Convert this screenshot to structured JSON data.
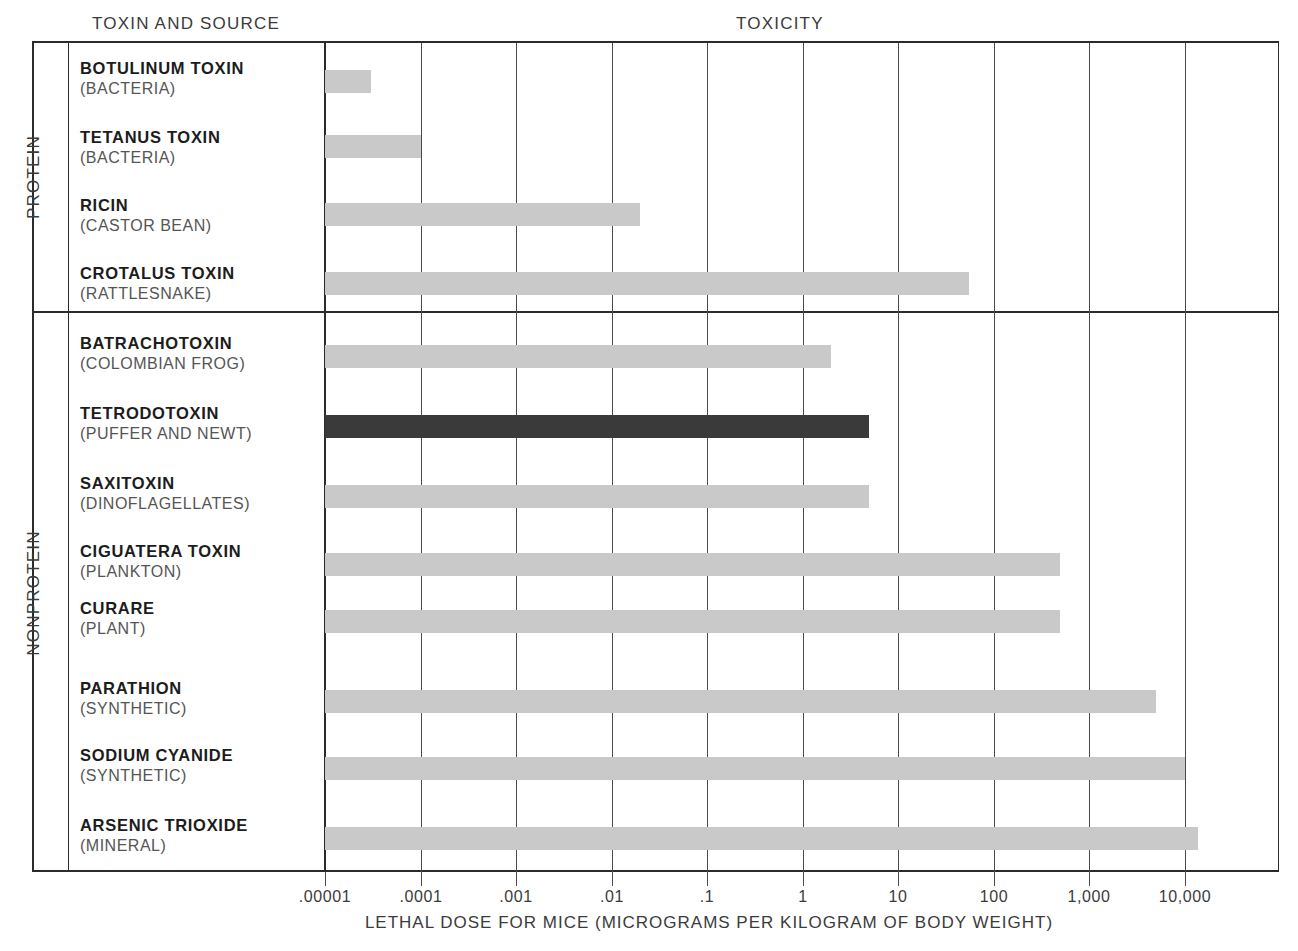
{
  "headings": {
    "left_column": "TOXIN AND SOURCE",
    "right_column": "TOXICITY"
  },
  "groups": [
    {
      "id": "protein",
      "label": "PROTEIN"
    },
    {
      "id": "nonprotein",
      "label": "NONPROTEIN"
    }
  ],
  "axis": {
    "title": "LETHAL DOSE FOR MICE (MICROGRAMS PER KILOGRAM OF BODY WEIGHT)",
    "tick_labels": [
      ".00001",
      ".0001",
      ".001",
      ".01",
      ".1",
      "1",
      "10",
      "100",
      "1,000",
      "10,000"
    ]
  },
  "colors": {
    "bar_light": "#c9c9c9",
    "bar_highlight": "#3a3a3a",
    "rule": "#2b2b2b",
    "gridline": "#4a4a4a",
    "text": "#1c1c1c",
    "text_secondary": "#555555"
  },
  "rows": [
    {
      "name": "BOTULINUM TOXIN",
      "source": "(BACTERIA)",
      "group": "protein",
      "value": 3e-05,
      "highlight": false
    },
    {
      "name": "TETANUS TOXIN",
      "source": "(BACTERIA)",
      "group": "protein",
      "value": 0.0001,
      "highlight": false
    },
    {
      "name": "RICIN",
      "source": "(CASTOR BEAN)",
      "group": "protein",
      "value": 0.02,
      "highlight": false
    },
    {
      "name": "CROTALUS TOXIN",
      "source": "(RATTLESNAKE)",
      "group": "protein",
      "value": 55,
      "highlight": false
    },
    {
      "name": "BATRACHOTOXIN",
      "source": "(COLOMBIAN FROG)",
      "group": "nonprotein",
      "value": 2,
      "highlight": false
    },
    {
      "name": "TETRODOTOXIN",
      "source": "(PUFFER AND NEWT)",
      "group": "nonprotein",
      "value": 5,
      "highlight": true
    },
    {
      "name": "SAXITOXIN",
      "source": "(DINOFLAGELLATES)",
      "group": "nonprotein",
      "value": 5,
      "highlight": false
    },
    {
      "name": "CIGUATERA TOXIN",
      "source": "(PLANKTON)",
      "group": "nonprotein",
      "value": 500,
      "highlight": false
    },
    {
      "name": "CURARE",
      "source": "(PLANT)",
      "group": "nonprotein",
      "value": 500,
      "highlight": false
    },
    {
      "name": "PARATHION",
      "source": "(SYNTHETIC)",
      "group": "nonprotein",
      "value": 5000,
      "highlight": false
    },
    {
      "name": "SODIUM CYANIDE",
      "source": "(SYNTHETIC)",
      "group": "nonprotein",
      "value": 10000,
      "highlight": false
    },
    {
      "name": "ARSENIC TRIOXIDE",
      "source": "(MINERAL)",
      "group": "nonprotein",
      "value": 14000,
      "highlight": false
    }
  ],
  "chart_data": {
    "type": "bar",
    "orientation": "horizontal",
    "title": "TOXICITY",
    "xlabel": "LETHAL DOSE FOR MICE (MICROGRAMS PER KILOGRAM OF BODY WEIGHT)",
    "ylabel": "TOXIN AND SOURCE",
    "xscale": "log",
    "xlim": [
      1e-05,
      1000000
    ],
    "xticks": [
      1e-05,
      0.0001,
      0.001,
      0.01,
      0.1,
      1,
      10,
      100,
      1000,
      10000
    ],
    "xticklabels": [
      ".00001",
      ".0001",
      ".001",
      ".01",
      ".1",
      "1",
      "10",
      "100",
      "1,000",
      "10,000"
    ],
    "grid": "vertical",
    "legend": "none",
    "categories": [
      "BOTULINUM TOXIN (BACTERIA)",
      "TETANUS TOXIN (BACTERIA)",
      "RICIN (CASTOR BEAN)",
      "CROTALUS TOXIN (RATTLESNAKE)",
      "BATRACHOTOXIN (COLOMBIAN FROG)",
      "TETRODOTOXIN (PUFFER AND NEWT)",
      "SAXITOXIN (DINOFLAGELLATES)",
      "CIGUATERA TOXIN (PLANKTON)",
      "CURARE (PLANT)",
      "PARATHION (SYNTHETIC)",
      "SODIUM CYANIDE (SYNTHETIC)",
      "ARSENIC TRIOXIDE (MINERAL)"
    ],
    "values": [
      3e-05,
      0.0001,
      0.02,
      55,
      2,
      5,
      5,
      500,
      500,
      5000,
      10000,
      14000
    ],
    "group_labels": [
      "PROTEIN",
      "NONPROTEIN"
    ],
    "group_spans": [
      [
        0,
        3
      ],
      [
        4,
        11
      ]
    ],
    "highlighted_index": 5
  }
}
